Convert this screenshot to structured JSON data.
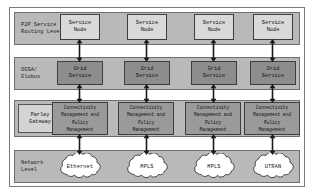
{
  "diagram": {
    "colors": {
      "band_fill": "#b9b9b9",
      "band_border": "#6f6f6f",
      "service_node_fill": "#d9d9d9",
      "grid_service_fill": "#8d8d8d",
      "conn_mgmt_fill": "#9a9a9a",
      "label_box_fill": "#d4d4d4",
      "cloud_fill": "#ffffff",
      "arrow_color": "#1a1a1a",
      "frame_border": "#7a7a7a"
    },
    "layers": [
      {
        "id": "p2p",
        "label": "P2P Service\nRouting Level",
        "nodes": [
          {
            "label": "Service\nNode"
          },
          {
            "label": "Service\nNode"
          },
          {
            "label": "Service\nNode"
          },
          {
            "label": "Service\nNode"
          }
        ]
      },
      {
        "id": "ogsa",
        "label": "OGSA/\nGlobus",
        "nodes": [
          {
            "label": "Grid\nService"
          },
          {
            "label": "Grid\nService"
          },
          {
            "label": "Grid\nService"
          },
          {
            "label": "Grid\nService"
          }
        ]
      },
      {
        "id": "parlay",
        "label": "Parlay\nGateway",
        "nodes": [
          {
            "label": "Connectivity\nManagement and\nPolicy\nManagement"
          },
          {
            "label": "Connectivity\nManagement and\nPolicy\nManagement"
          },
          {
            "label": "Connectivity\nManagement and\nPolicy\nManagement"
          },
          {
            "label": "Connectivity\nManagement and\nPolicy\nManagement"
          }
        ]
      },
      {
        "id": "network",
        "label": "Network\nLevel",
        "nodes": [
          {
            "label": "Ethernet"
          },
          {
            "label": "MPLS"
          },
          {
            "label": "MPLS"
          },
          {
            "label": "UTRAN"
          }
        ]
      }
    ],
    "connectors": {
      "kind": "double-headed-vertical-arrow",
      "count": 12
    }
  }
}
